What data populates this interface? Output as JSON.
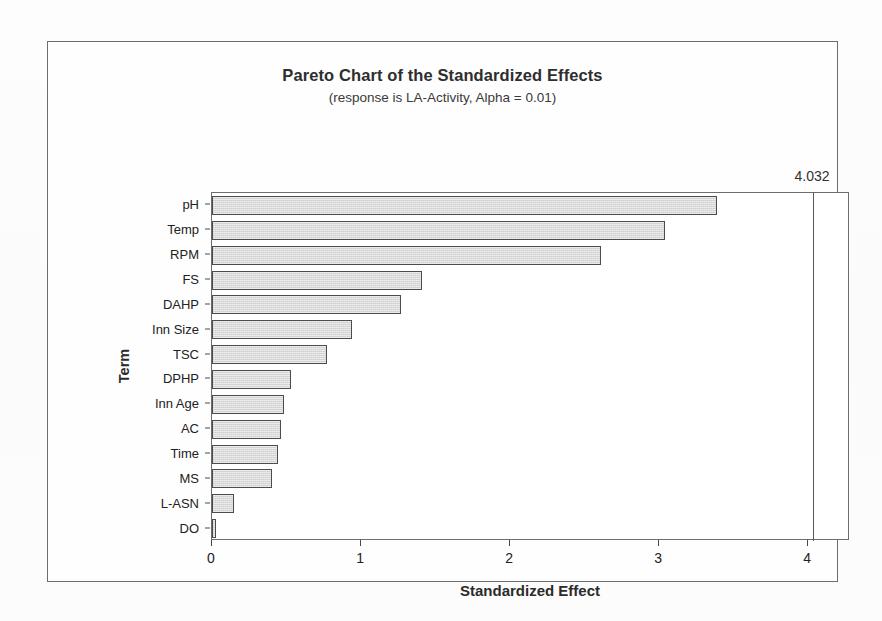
{
  "figure": {
    "title": "Pareto Chart of the Standardized Effects",
    "subtitle": "(response is LA-Activity, Alpha = 0.01)",
    "frame_color": "#6d6d6d",
    "bar_fill": "#d8d8d8",
    "bar_edge": "#4c4c4c",
    "background": "#ffffff"
  },
  "chart_data": {
    "type": "bar",
    "orientation": "horizontal",
    "title": "Pareto Chart of the Standardized Effects",
    "subtitle": "(response is LA-Activity, Alpha = 0.01)",
    "xlabel": "Standardized Effect",
    "ylabel": "Term",
    "categories": [
      "pH",
      "Temp",
      "RPM",
      "FS",
      "DAHP",
      "Inn Size",
      "TSC",
      "DPHP",
      "Inn Age",
      "AC",
      "Time",
      "MS",
      "L-ASN",
      "DO"
    ],
    "values": [
      3.39,
      3.04,
      2.61,
      1.41,
      1.27,
      0.94,
      0.77,
      0.53,
      0.48,
      0.46,
      0.44,
      0.4,
      0.15,
      0.03
    ],
    "xlim": [
      0,
      4.28
    ],
    "xticks": [
      0,
      1,
      2,
      3,
      4
    ],
    "xtick_labels": [
      "0",
      "1",
      "2",
      "3",
      "4"
    ],
    "grid": false,
    "legend": false,
    "reference_line": {
      "value": 4.032,
      "label": "4.032",
      "orientation": "vertical",
      "color": "#5a5a5a"
    }
  }
}
